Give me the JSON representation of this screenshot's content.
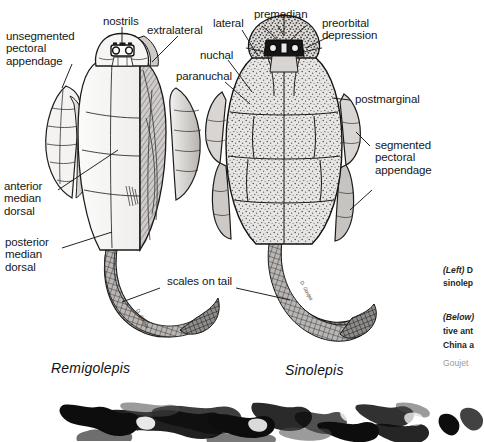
{
  "figure": {
    "background": "#ffffff",
    "ink": "#171717",
    "specimens": [
      {
        "name": "Remigolepis",
        "side": "left"
      },
      {
        "name": "Sinolepis",
        "side": "right"
      }
    ],
    "labels_left_specimen": [
      {
        "id": "unsegmented-pectoral-appendage",
        "text": "unsegmented\npectoral\nappendage"
      },
      {
        "id": "nostrils",
        "text": "nostrils"
      },
      {
        "id": "extralateral",
        "text": "extralateral"
      },
      {
        "id": "anterior-median-dorsal",
        "text": "anterior\nmedian\ndorsal"
      },
      {
        "id": "posterior-median-dorsal",
        "text": "posterior\nmedian\ndorsal"
      }
    ],
    "labels_right_specimen": [
      {
        "id": "lateral",
        "text": "lateral"
      },
      {
        "id": "premedian",
        "text": "premedian"
      },
      {
        "id": "preorbital-depression",
        "text": "preorbital\ndepression"
      },
      {
        "id": "nuchal",
        "text": "nuchal"
      },
      {
        "id": "paranuchal",
        "text": "paranuchal"
      },
      {
        "id": "postmarginal",
        "text": "postmarginal"
      },
      {
        "id": "segmented-pectoral-appendage",
        "text": "segmented\npectoral\nappendage"
      }
    ],
    "labels_shared": [
      {
        "id": "scales-on-tail",
        "text": "scales on tail"
      }
    ]
  },
  "caption": {
    "block_one_line_one": "(Left) D",
    "block_one_line_two": "sinolep",
    "block_two_line_one": "(Below)",
    "block_two_line_two": "tive ant",
    "block_two_line_three": "China a",
    "credit": "Goujet"
  },
  "photo_strip": {
    "name": "fossil-specimen-photograph"
  }
}
